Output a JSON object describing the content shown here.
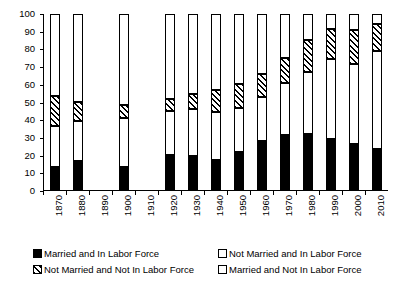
{
  "chart_data": {
    "type": "bar",
    "subtype": "stacked-percentage",
    "title": "",
    "xlabel": "",
    "ylabel": "",
    "ylim": [
      0,
      100
    ],
    "ytick_step": 10,
    "yticks": [
      0,
      10,
      20,
      30,
      40,
      50,
      60,
      70,
      80,
      90,
      100
    ],
    "grid": false,
    "legend_position": "bottom",
    "categories": [
      "1870",
      "1880",
      "1890",
      "1900",
      "1910",
      "1920",
      "1930",
      "1940",
      "1950",
      "1960",
      "1970",
      "1980",
      "1990",
      "2000",
      "2010"
    ],
    "missing_categories": [
      "1890",
      "1910"
    ],
    "series": [
      {
        "name": "Married and In Labor Force",
        "pattern": "solid-black",
        "color": "#000000",
        "values": [
          13.5,
          17.0,
          null,
          13.5,
          null,
          20.5,
          20.0,
          17.5,
          22.0,
          28.0,
          31.5,
          32.0,
          29.5,
          26.5,
          23.5
        ]
      },
      {
        "name": "Not Married and In Labor Force",
        "pattern": "dotted",
        "color": "#ffffff",
        "values": [
          23.5,
          22.5,
          null,
          27.5,
          null,
          24.5,
          26.5,
          27.0,
          25.0,
          25.0,
          29.5,
          35.5,
          45.0,
          45.5,
          55.5
        ]
      },
      {
        "name": "Not Married and Not In Labor Force",
        "pattern": "diagonal-hatch",
        "color": "#ffffff",
        "values": [
          16.5,
          11.0,
          null,
          7.5,
          null,
          7.0,
          8.5,
          12.5,
          13.5,
          13.0,
          14.0,
          18.0,
          17.0,
          19.0,
          15.5
        ]
      },
      {
        "name": "Married and Not In Labor Force",
        "pattern": "white",
        "color": "#ffffff",
        "values": [
          46.5,
          49.5,
          null,
          51.5,
          null,
          48.0,
          45.0,
          43.0,
          39.5,
          34.0,
          25.0,
          14.5,
          8.5,
          9.0,
          5.5
        ]
      }
    ],
    "cumulative_tops": [
      {
        "category": "1870",
        "s1": 13.5,
        "s2": 37.0,
        "s3": 53.5,
        "s4": 100
      },
      {
        "category": "1880",
        "s1": 17.0,
        "s2": 39.5,
        "s3": 50.5,
        "s4": 100
      },
      {
        "category": "1900",
        "s1": 13.5,
        "s2": 41.0,
        "s3": 48.5,
        "s4": 100
      },
      {
        "category": "1920",
        "s1": 20.5,
        "s2": 45.0,
        "s3": 52.0,
        "s4": 100
      },
      {
        "category": "1930",
        "s1": 20.0,
        "s2": 46.5,
        "s3": 55.0,
        "s4": 100
      },
      {
        "category": "1940",
        "s1": 17.5,
        "s2": 44.5,
        "s3": 57.0,
        "s4": 100
      },
      {
        "category": "1950",
        "s1": 22.0,
        "s2": 47.0,
        "s3": 60.5,
        "s4": 100
      },
      {
        "category": "1960",
        "s1": 28.0,
        "s2": 53.0,
        "s3": 66.0,
        "s4": 100
      },
      {
        "category": "1970",
        "s1": 31.5,
        "s2": 61.0,
        "s3": 75.0,
        "s4": 100
      },
      {
        "category": "1980",
        "s1": 32.0,
        "s2": 67.5,
        "s3": 85.5,
        "s4": 100
      },
      {
        "category": "1990",
        "s1": 29.5,
        "s2": 74.5,
        "s3": 91.5,
        "s4": 100
      },
      {
        "category": "2000",
        "s1": 26.5,
        "s2": 72.0,
        "s3": 91.0,
        "s4": 100
      },
      {
        "category": "2010",
        "s1": 23.5,
        "s2": 79.0,
        "s3": 94.5,
        "s4": 100
      }
    ]
  },
  "legend": {
    "entries": [
      {
        "label": "Married and In Labor Force",
        "pattern": "solid-black"
      },
      {
        "label": "Not Married and In Labor Force",
        "pattern": "dotted"
      },
      {
        "label": "Not Married and Not In Labor Force",
        "pattern": "diagonal-hatch"
      },
      {
        "label": "Married and Not In Labor Force",
        "pattern": "white"
      }
    ]
  }
}
